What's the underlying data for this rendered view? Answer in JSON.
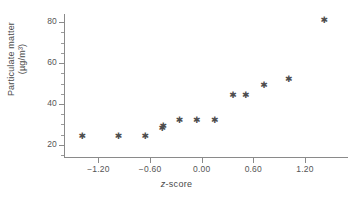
{
  "chart_data": {
    "type": "scatter",
    "title": "",
    "xlabel": "z-score",
    "ylabel_line1": "Particulate matter",
    "ylabel_line2": "(µg/m³)",
    "xlim": [
      -1.6,
      1.7
    ],
    "ylim": [
      14,
      84
    ],
    "xticks": [
      -1.2,
      -0.6,
      0.0,
      0.6,
      1.2
    ],
    "xtick_labels": [
      "−1.20",
      "−0.60",
      "0.00",
      "0.60",
      "1.20"
    ],
    "yticks": [
      20,
      40,
      60,
      80
    ],
    "ytick_labels": [
      "20",
      "40",
      "60",
      "80"
    ],
    "yminor_ticks": [
      15,
      25,
      30,
      35,
      45,
      50,
      55,
      65,
      70,
      75
    ],
    "grid": false,
    "legend": false,
    "marker": "asterisk",
    "marker_color": "#4d4d4d",
    "axis_color": "#8a8a8a",
    "background": "#ffffff",
    "points": [
      {
        "x": -1.39,
        "y": 24
      },
      {
        "x": -0.97,
        "y": 24
      },
      {
        "x": -0.66,
        "y": 24
      },
      {
        "x": -0.46,
        "y": 28
      },
      {
        "x": -0.45,
        "y": 29
      },
      {
        "x": -0.26,
        "y": 32
      },
      {
        "x": -0.06,
        "y": 32
      },
      {
        "x": 0.15,
        "y": 32
      },
      {
        "x": 0.36,
        "y": 44
      },
      {
        "x": 0.51,
        "y": 44
      },
      {
        "x": 0.72,
        "y": 49
      },
      {
        "x": 1.01,
        "y": 52
      },
      {
        "x": 1.42,
        "y": 81
      }
    ]
  }
}
